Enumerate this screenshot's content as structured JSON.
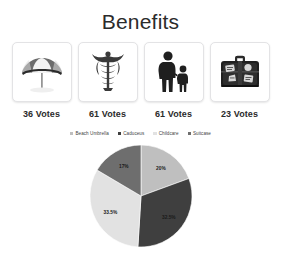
{
  "page": {
    "title": "Benefits",
    "clipped_header_ghosts": [
      "",
      "",
      "",
      ""
    ]
  },
  "cards": [
    {
      "icon": "beach-umbrella-icon",
      "name": "Beach Umbrella",
      "votes_label": "36 Votes",
      "votes": 36
    },
    {
      "icon": "caduceus-icon",
      "name": "Caduceus",
      "votes_label": "61 Votes",
      "votes": 61
    },
    {
      "icon": "childcare-icon",
      "name": "Childcare",
      "votes_label": "61 Votes",
      "votes": 61
    },
    {
      "icon": "suitcase-icon",
      "name": "Suitcase",
      "votes_label": "23 Votes",
      "votes": 23
    }
  ],
  "legend": {
    "position": "top",
    "items": [
      {
        "label": "Beach Umbrella",
        "color": "#bfbfbf"
      },
      {
        "label": "Caduceus",
        "color": "#3f3f3f"
      },
      {
        "label": "Childcare",
        "color": "#e2e2e2"
      },
      {
        "label": "Suitcase",
        "color": "#6e6e6e"
      }
    ]
  },
  "chart_data": {
    "type": "pie",
    "title": "",
    "categories": [
      "Beach Umbrella",
      "Caduceus",
      "Childcare",
      "Suitcase"
    ],
    "values": [
      20,
      32.5,
      33.5,
      17
    ],
    "labels": [
      "20%",
      "32.5%",
      "33.5%",
      "17%"
    ],
    "colors": [
      "#bfbfbf",
      "#3f3f3f",
      "#e2e2e2",
      "#6e6e6e"
    ],
    "label_colors": [
      "#1a1a1a",
      "#f2f2f2",
      "#1a1a1a",
      "#f2f2f2"
    ],
    "start_angle_deg": 0,
    "direction": "clockwise",
    "legend_position": "top",
    "grid": false
  }
}
